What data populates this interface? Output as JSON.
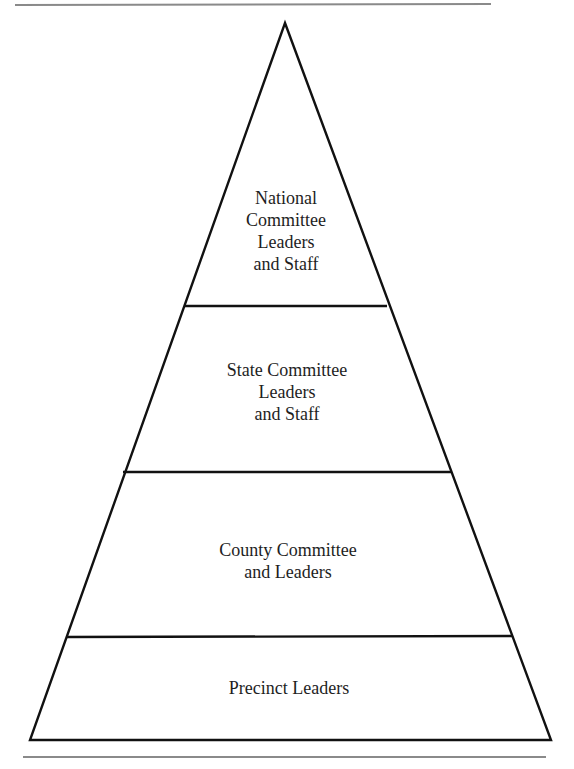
{
  "diagram": {
    "type": "pyramid",
    "tiers": [
      {
        "level": 1,
        "position": "top",
        "lines": [
          "National",
          "Committee",
          "Leaders",
          "and Staff"
        ]
      },
      {
        "level": 2,
        "position": "upper-middle",
        "lines": [
          "State Committee",
          "Leaders",
          "and Staff"
        ]
      },
      {
        "level": 3,
        "position": "lower-middle",
        "lines": [
          "County Committee",
          "and Leaders"
        ]
      },
      {
        "level": 4,
        "position": "bottom",
        "lines": [
          "Precinct Leaders"
        ]
      }
    ]
  },
  "colors": {
    "outline": "#111111",
    "text": "#1e1e1e",
    "rule": "#8a8a8a",
    "background": "#ffffff"
  }
}
